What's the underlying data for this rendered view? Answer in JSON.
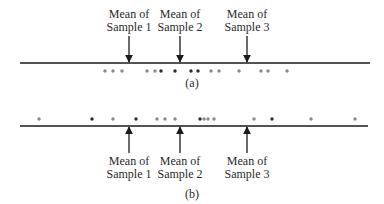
{
  "panels": [
    {
      "id": "a",
      "caption": "(a)",
      "axis": {
        "y": 63,
        "x1": 20,
        "x2": 370
      },
      "means": [
        {
          "line1": "Mean of",
          "line2": "Sample 1",
          "x": 129
        },
        {
          "line1": "Mean of",
          "line2": "Sample 2",
          "x": 180
        },
        {
          "line1": "Mean of",
          "line2": "Sample 3",
          "x": 247
        }
      ],
      "arrow_direction": "down",
      "dots_y": 71,
      "dots": [
        {
          "x": 105,
          "shade": "light"
        },
        {
          "x": 113,
          "shade": "light"
        },
        {
          "x": 122,
          "shade": "light"
        },
        {
          "x": 147,
          "shade": "light"
        },
        {
          "x": 155,
          "shade": "light"
        },
        {
          "x": 161,
          "shade": "dark"
        },
        {
          "x": 175,
          "shade": "dark"
        },
        {
          "x": 191,
          "shade": "dark"
        },
        {
          "x": 198,
          "shade": "dark"
        },
        {
          "x": 211,
          "shade": "light"
        },
        {
          "x": 219,
          "shade": "light"
        },
        {
          "x": 239,
          "shade": "light"
        },
        {
          "x": 261,
          "shade": "light"
        },
        {
          "x": 268,
          "shade": "light"
        },
        {
          "x": 287,
          "shade": "light"
        }
      ]
    },
    {
      "id": "b",
      "caption": "(b)",
      "axis": {
        "y": 126,
        "x1": 20,
        "x2": 368
      },
      "means": [
        {
          "line1": "Mean of",
          "line2": "Sample 1",
          "x": 129
        },
        {
          "line1": "Mean of",
          "line2": "Sample 2",
          "x": 180
        },
        {
          "line1": "Mean of",
          "line2": "Sample 3",
          "x": 247
        }
      ],
      "arrow_direction": "up",
      "dots_y": 119,
      "dots": [
        {
          "x": 39,
          "shade": "light"
        },
        {
          "x": 92,
          "shade": "dark"
        },
        {
          "x": 113,
          "shade": "light"
        },
        {
          "x": 136,
          "shade": "dark"
        },
        {
          "x": 157,
          "shade": "light"
        },
        {
          "x": 165,
          "shade": "light"
        },
        {
          "x": 175,
          "shade": "light"
        },
        {
          "x": 200,
          "shade": "dark"
        },
        {
          "x": 204,
          "shade": "light"
        },
        {
          "x": 208,
          "shade": "light"
        },
        {
          "x": 214,
          "shade": "light"
        },
        {
          "x": 254,
          "shade": "light"
        },
        {
          "x": 272,
          "shade": "dark"
        },
        {
          "x": 311,
          "shade": "light"
        },
        {
          "x": 355,
          "shade": "light"
        }
      ]
    }
  ],
  "colors": {
    "line": "#1a1a1a",
    "dot_dark": "#2b2b2b",
    "dot_light": "#8a8a8a",
    "text": "#2a2a2a"
  }
}
